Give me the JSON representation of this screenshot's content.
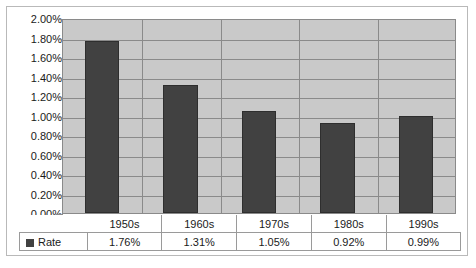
{
  "chart_data": {
    "type": "bar",
    "title": "",
    "xlabel": "",
    "ylabel": "",
    "categories": [
      "1950s",
      "1960s",
      "1970s",
      "1980s",
      "1990s"
    ],
    "series": [
      {
        "name": "Rate",
        "values": [
          1.76,
          1.31,
          1.05,
          0.92,
          0.99
        ],
        "value_labels": [
          "1.76%",
          "1.31%",
          "1.05%",
          "0.92%",
          "0.99%"
        ],
        "color": "#414141"
      }
    ],
    "ylim": [
      0,
      2.0
    ],
    "ytick_values": [
      2.0,
      1.8,
      1.6,
      1.4,
      1.2,
      1.0,
      0.8,
      0.6,
      0.4,
      0.2,
      0.0
    ],
    "ytick_labels": [
      "2.00%",
      "1.80%",
      "1.60%",
      "1.40%",
      "1.20%",
      "1.00%",
      "0.80%",
      "0.60%",
      "0.40%",
      "0.20%",
      "0.00%"
    ],
    "grid": true,
    "legend_position": "data-table-left",
    "plot_background": "#c9c9c9",
    "gridline_color": "#8a8a8a",
    "frame_color": "#b9b9b9"
  },
  "legend": {
    "series_label": "Rate",
    "swatch_color": "#414141"
  }
}
